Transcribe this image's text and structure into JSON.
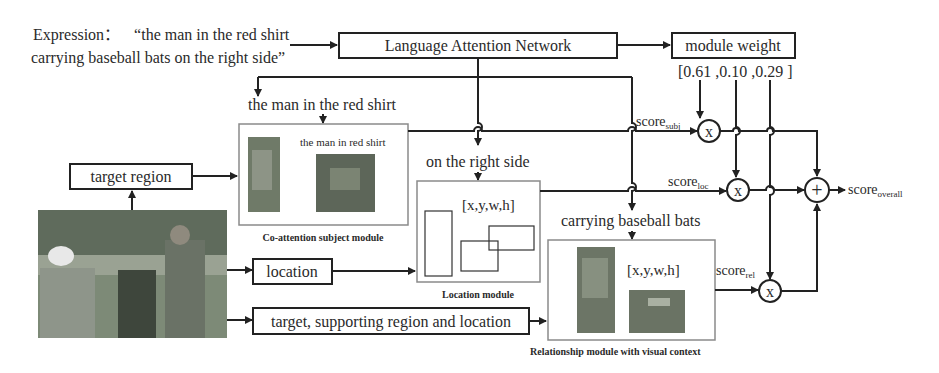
{
  "expression": {
    "label": "Expression：",
    "line1": "“the man in the red shirt",
    "line2": "carrying baseball bats on the right side”"
  },
  "language_attention_network": {
    "label": "Language Attention Network"
  },
  "module_weight": {
    "label": "module weight",
    "values_text": "[0.61 ,0.10 ,0.29 ]",
    "values": [
      0.61,
      0.1,
      0.29
    ]
  },
  "phrases": {
    "subject": "the man in the red shirt",
    "location": "on the right side",
    "relationship": "carrying baseball bats"
  },
  "inputs": {
    "target_region": "target region",
    "location": "location",
    "target_supporting": "target, supporting region and location"
  },
  "modules": {
    "subject": {
      "caption": "Co-attention subject module",
      "inner_text": "the man in red shirt"
    },
    "location": {
      "caption": "Location module",
      "coords": "[x,y,w,h]"
    },
    "relationship": {
      "caption": "Relationship module with visual context",
      "coords": "[x,y,w,h]"
    }
  },
  "scores": {
    "subj": {
      "base": "score",
      "sub": "subj"
    },
    "loc": {
      "base": "score",
      "sub": "loc"
    },
    "rel": {
      "base": "score",
      "sub": "rel"
    },
    "overall": {
      "base": "score",
      "sub": "overall"
    }
  },
  "operators": {
    "multiply": "x",
    "add": "+"
  }
}
